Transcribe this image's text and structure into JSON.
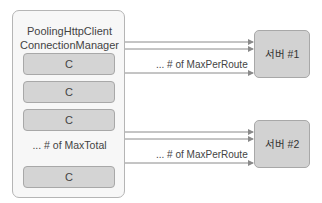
{
  "manager": {
    "title_line1": "PoolingHttpClient",
    "title_line2": "ConnectionManager",
    "connections": [
      "C",
      "C",
      "C",
      "C"
    ],
    "max_total_label": "... # of MaxTotal"
  },
  "servers": [
    {
      "label": "서버 #1",
      "route_label": "... # of MaxPerRoute"
    },
    {
      "label": "서버 #2",
      "route_label": "... # of MaxPerRoute"
    }
  ],
  "colors": {
    "box_fill": "#d4d4d4",
    "outer_fill": "#f7f7f7",
    "border": "#b5b5b5",
    "arrow": "#8a8a8a"
  }
}
